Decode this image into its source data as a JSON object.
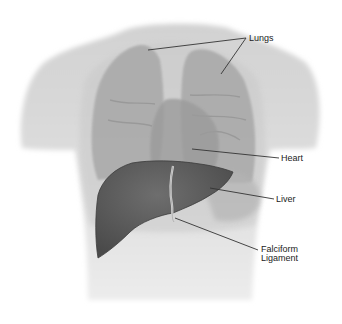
{
  "diagram": {
    "labels": {
      "lungs": "Lungs",
      "heart": "Heart",
      "liver": "Liver",
      "falciform_line1": "Falciform",
      "falciform_line2": "Ligament"
    },
    "colors": {
      "background": "#ffffff",
      "torso": "#dcdcdc",
      "lungs": "#a9a9a9",
      "heart": "#9a9a9a",
      "liver": "#5c5c5c",
      "ligament": "#d8d8d8",
      "leader_line": "#333333",
      "label_text": "#222222"
    }
  }
}
